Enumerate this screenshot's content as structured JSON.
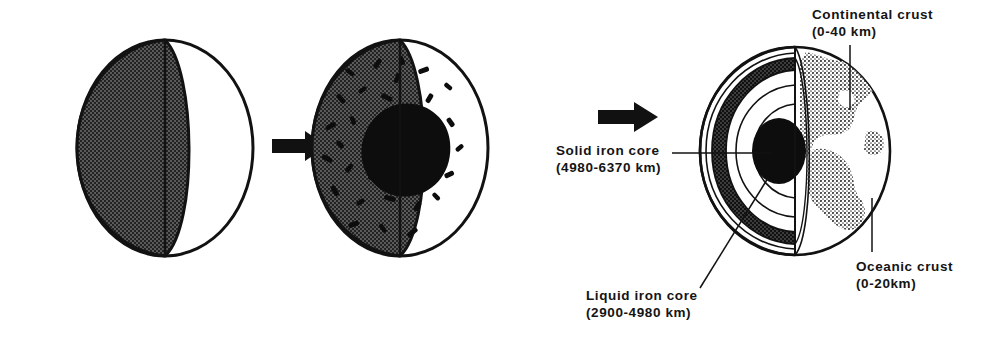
{
  "figure": {
    "stages": [
      {
        "id": "stage-1",
        "name": "homogeneous-earth",
        "caption": ""
      },
      {
        "id": "stage-2",
        "name": "iron-sinking",
        "caption": ""
      },
      {
        "id": "stage-3",
        "name": "differentiated-earth",
        "caption": ""
      }
    ],
    "arrows": [
      {
        "id": "arrow-1",
        "name": "stage-arrow-1"
      },
      {
        "id": "arrow-2",
        "name": "stage-arrow-2"
      }
    ],
    "labels": {
      "solid_core": {
        "line1": "Solid iron core",
        "line2": "(4980-6370 km)"
      },
      "liquid_core": {
        "line1": "Liquid iron core",
        "line2": "(2900-4980 km)"
      },
      "continental_crust": {
        "line1": "Continental crust",
        "line2": "(0-40 km)"
      },
      "oceanic_crust": {
        "line1": "Oceanic crust",
        "line2": "(0-20km)"
      }
    },
    "colors": {
      "ink": "#141414",
      "stipple_gray": "#4a4a4a",
      "mantle_band": "#3a3a3a",
      "core_black": "#0d0d0d",
      "paper": "#ffffff"
    }
  }
}
